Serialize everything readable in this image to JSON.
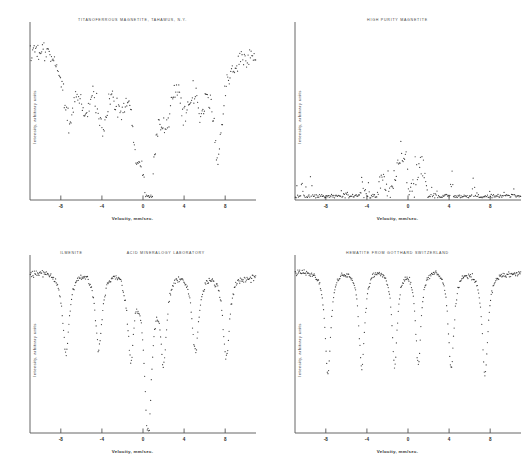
{
  "figure": {
    "background": "#ffffff",
    "axis_color": "#555555",
    "point_color": "#1a1a1a",
    "layout": "2x2 grid of Mossbauer absorption spectra"
  },
  "common": {
    "xlabel": "Velocity, mm/sec.",
    "ylabel": "Intensity, arbitrary units",
    "xticks": [
      "-8",
      "-4",
      "0",
      "4",
      "8"
    ],
    "xtick_values": [
      -8,
      -4,
      0,
      4,
      8
    ]
  },
  "chart_data": [
    {
      "type": "scatter",
      "title": "TITANOFERROUS MAGNETITE, TAHAWUS, N.Y.",
      "subtitle": "",
      "xlabel": "Velocity, mm/sec.",
      "ylabel": "Intensity, arbitrary units",
      "xlim": [
        -11,
        11
      ],
      "ylim": [
        0,
        1
      ],
      "grid": false,
      "legend": "none",
      "noise": 0.055,
      "baseline_kind": "sloped",
      "baseline_left": 0.97,
      "baseline_right": 0.93,
      "baseline_curve": 0.1,
      "n_points": 300,
      "lines": [
        {
          "center": -7.2,
          "depth": 0.4,
          "width": 0.72
        },
        {
          "center": -5.6,
          "depth": 0.3,
          "width": 0.62
        },
        {
          "center": -3.9,
          "depth": 0.42,
          "width": 0.68
        },
        {
          "center": -2.2,
          "depth": 0.26,
          "width": 0.7
        },
        {
          "center": -0.6,
          "depth": 0.38,
          "width": 0.62
        },
        {
          "center": 0.6,
          "depth": 0.86,
          "width": 0.72
        },
        {
          "center": 2.3,
          "depth": 0.3,
          "width": 0.6
        },
        {
          "center": 4.1,
          "depth": 0.34,
          "width": 0.6
        },
        {
          "center": 5.6,
          "depth": 0.3,
          "width": 0.55
        },
        {
          "center": 7.3,
          "depth": 0.58,
          "width": 0.6
        }
      ]
    },
    {
      "type": "scatter",
      "title": "HIGH PURITY MAGNETITE",
      "subtitle": "",
      "xlabel": "Velocity, mm/sec.",
      "ylabel": "Intensity, arbitrary units",
      "xlim": [
        -11,
        11
      ],
      "ylim": [
        0,
        1
      ],
      "grid": false,
      "legend": "none",
      "noise": 0.085,
      "baseline_kind": "domed",
      "baseline_left": 0.46,
      "baseline_right": 0.44,
      "baseline_curve": 0.46,
      "n_points": 300,
      "lines": [
        {
          "center": -8.6,
          "depth": 0.26,
          "width": 0.6
        },
        {
          "center": -7.0,
          "depth": 0.3,
          "width": 0.58
        },
        {
          "center": -5.2,
          "depth": 0.4,
          "width": 0.62
        },
        {
          "center": -3.4,
          "depth": 0.44,
          "width": 0.6
        },
        {
          "center": -1.6,
          "depth": 0.3,
          "width": 0.58
        },
        {
          "center": 0.4,
          "depth": 0.3,
          "width": 0.58
        },
        {
          "center": 2.2,
          "depth": 0.28,
          "width": 0.56
        },
        {
          "center": 3.4,
          "depth": 0.48,
          "width": 0.6
        },
        {
          "center": 5.3,
          "depth": 0.58,
          "width": 0.6
        },
        {
          "center": 7.2,
          "depth": 0.3,
          "width": 0.58
        },
        {
          "center": 8.8,
          "depth": 0.26,
          "width": 0.58
        }
      ]
    },
    {
      "type": "scatter",
      "title": "ILMENITE",
      "subtitle": "ACID MINERALOGY LABORATORY",
      "xlabel": "Velocity, mm/sec.",
      "ylabel": "Intensity, arbitrary units",
      "xlim": [
        -11,
        11
      ],
      "ylim": [
        0,
        1
      ],
      "grid": false,
      "legend": "none",
      "noise": 0.018,
      "baseline_kind": "sloped",
      "baseline_left": 0.97,
      "baseline_right": 0.95,
      "baseline_curve": 0.06,
      "n_points": 340,
      "lines": [
        {
          "center": -7.5,
          "depth": 0.48,
          "width": 0.38
        },
        {
          "center": -4.3,
          "depth": 0.46,
          "width": 0.4
        },
        {
          "center": -1.2,
          "depth": 0.48,
          "width": 0.36
        },
        {
          "center": 0.5,
          "depth": 0.95,
          "width": 0.42
        },
        {
          "center": 2.0,
          "depth": 0.48,
          "width": 0.36
        },
        {
          "center": 5.1,
          "depth": 0.46,
          "width": 0.4
        },
        {
          "center": 8.1,
          "depth": 0.48,
          "width": 0.38
        }
      ]
    },
    {
      "type": "scatter",
      "title": "HEMATITE FROM GOTTHARD SWITZERLAND",
      "subtitle": "",
      "xlabel": "Velocity, mm/sec.",
      "ylabel": "Intensity, arbitrary units",
      "xlim": [
        -11,
        11
      ],
      "ylim": [
        0,
        1
      ],
      "grid": false,
      "legend": "none",
      "noise": 0.014,
      "baseline_kind": "sloped",
      "baseline_left": 0.97,
      "baseline_right": 0.96,
      "baseline_curve": 0.05,
      "n_points": 360,
      "lines": [
        {
          "center": -7.8,
          "depth": 0.6,
          "width": 0.34
        },
        {
          "center": -4.5,
          "depth": 0.58,
          "width": 0.34
        },
        {
          "center": -1.3,
          "depth": 0.56,
          "width": 0.32
        },
        {
          "center": 1.0,
          "depth": 0.56,
          "width": 0.32
        },
        {
          "center": 4.2,
          "depth": 0.58,
          "width": 0.34
        },
        {
          "center": 7.5,
          "depth": 0.6,
          "width": 0.34
        }
      ]
    }
  ]
}
